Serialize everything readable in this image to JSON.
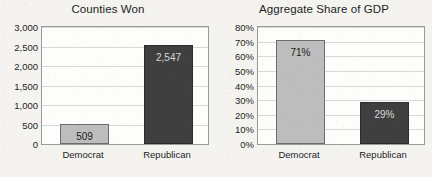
{
  "chart_data": [
    {
      "id": "counties",
      "type": "bar",
      "title": "Counties Won",
      "xlabel": "",
      "ylabel": "",
      "categories": [
        "Democrat",
        "Republican"
      ],
      "values": [
        509,
        2547
      ],
      "data_labels": [
        "509",
        "2,547"
      ],
      "ylim": [
        0,
        3000
      ],
      "ytick_values": [
        3000,
        2500,
        2000,
        1500,
        1000,
        500,
        0
      ],
      "ytick_labels": [
        "3,000",
        "2,500",
        "2,000",
        "1,500",
        "1,000",
        "500",
        "0"
      ],
      "bar_colors": [
        "#bdbdbd",
        "#3f3f3f"
      ],
      "grid": true,
      "legend": "none"
    },
    {
      "id": "gdp",
      "type": "bar",
      "title": "Aggregate Share of GDP",
      "xlabel": "",
      "ylabel": "",
      "categories": [
        "Democrat",
        "Republican"
      ],
      "values": [
        71,
        29
      ],
      "data_labels": [
        "71%",
        "29%"
      ],
      "ylim": [
        0,
        80
      ],
      "ytick_values": [
        80,
        70,
        60,
        50,
        40,
        30,
        20,
        10,
        0
      ],
      "ytick_labels": [
        "80%",
        "70%",
        "60%",
        "50%",
        "40%",
        "30%",
        "20%",
        "10%",
        "0%"
      ],
      "bar_colors": [
        "#bdbdbd",
        "#3f3f3f"
      ],
      "grid": true,
      "legend": "none"
    }
  ],
  "colors": {
    "page_background": "#f4f3f0",
    "plot_background": "#fdfdfc",
    "axis_line": "#9a9a9a",
    "gridline": "#d8d8d6",
    "democrat_bar": "#bdbdbd",
    "republican_bar": "#3f3f3f",
    "text": "#1d1d1d"
  }
}
